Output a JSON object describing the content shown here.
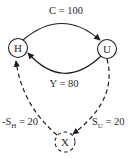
{
  "diagram": {
    "background_color": "#ffffff",
    "stroke_color": "#1f1f1f",
    "text_color": "#2a2a2a",
    "nodes": [
      {
        "id": "H",
        "label": "H",
        "shape": "circle",
        "border": "solid",
        "position": "left"
      },
      {
        "id": "U",
        "label": "U",
        "shape": "circle",
        "border": "solid",
        "position": "right"
      },
      {
        "id": "X",
        "label": "X",
        "shape": "circle",
        "border": "dashed",
        "position": "bottom-center"
      }
    ],
    "edges": [
      {
        "id": "C",
        "label": "C = 100",
        "value": 100,
        "from": "H",
        "to": "U",
        "style": "solid",
        "arrow_at": "U"
      },
      {
        "id": "Y",
        "label": "Y = 80",
        "value": 80,
        "from": "U",
        "to": "H",
        "style": "solid",
        "arrow_at": "H"
      },
      {
        "id": "-S_H",
        "label_main": "-S",
        "label_sub": "H",
        "label_suffix": " = 20",
        "value": 20,
        "from": "X",
        "to": "H",
        "style": "dashed",
        "arrow_at": "H"
      },
      {
        "id": "S_U",
        "label_main": "S",
        "label_sub": "U",
        "label_suffix": " = 20",
        "value": 20,
        "from": "U",
        "to": "X",
        "style": "dashed",
        "arrow_at": "X"
      }
    ]
  }
}
